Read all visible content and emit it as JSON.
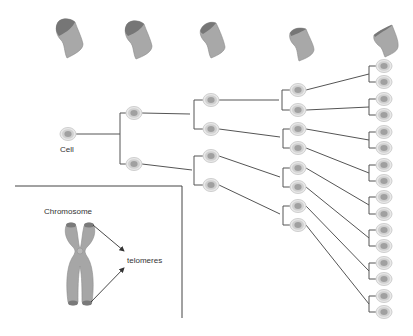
{
  "diagram": {
    "colors": {
      "line": "#555555",
      "cell_outer": "#e6e6e6",
      "cell_ring": "#c8c8c8",
      "cell_nucleus": "#a3a3a3",
      "chromosome_body": "#a6a6a6",
      "telomere_cap": "#7a7a7a"
    },
    "labels": {
      "cell": "Cell",
      "chromosome": "Chromosome",
      "telomeres": "telomeres"
    },
    "chromosome_fragments": [
      {
        "generation": 0,
        "x": 55,
        "cap_size": "large"
      },
      {
        "generation": 1,
        "x": 123,
        "cap_size": "large"
      },
      {
        "generation": 2,
        "x": 198,
        "cap_size": "medium"
      },
      {
        "generation": 3,
        "x": 288,
        "cap_size": "small"
      },
      {
        "generation": 4,
        "x": 373,
        "cap_size": "minimal"
      }
    ],
    "generations": [
      {
        "level": 0,
        "cell_count": 1
      },
      {
        "level": 1,
        "cell_count": 2
      },
      {
        "level": 2,
        "cell_count": 4
      },
      {
        "level": 3,
        "cell_count": 8
      },
      {
        "level": 4,
        "cell_count": 16
      }
    ],
    "inset": {
      "title": "Chromosome",
      "annotation": "telomeres"
    }
  }
}
